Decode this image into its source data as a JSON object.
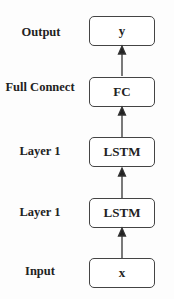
{
  "layers": [
    {
      "label": "Output",
      "node": "y"
    },
    {
      "label": "Full Connect",
      "node": "FC"
    },
    {
      "label": "Layer 1",
      "node": "LSTM"
    },
    {
      "label": "Layer 1",
      "node": "LSTM"
    },
    {
      "label": "Input",
      "node": "x"
    }
  ],
  "edges": [
    {
      "from": "x",
      "to": "LSTM (lower)"
    },
    {
      "from": "LSTM (lower)",
      "to": "LSTM (upper)"
    },
    {
      "from": "LSTM (upper)",
      "to": "FC"
    },
    {
      "from": "FC",
      "to": "y"
    }
  ]
}
